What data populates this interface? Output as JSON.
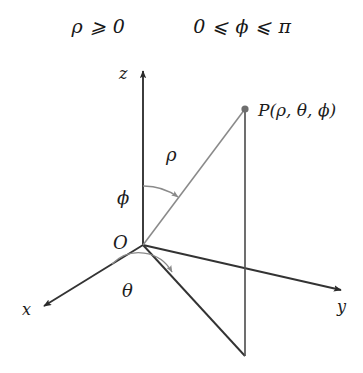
{
  "figure": {
    "title_conditions": [
      {
        "id": "rho-condition",
        "text": "ρ ⩾ 0"
      },
      {
        "id": "phi-condition",
        "text": "0 ⩽ ϕ ⩽ π"
      }
    ],
    "axes": [
      {
        "name": "z",
        "label": "z"
      },
      {
        "name": "x",
        "label": "x"
      },
      {
        "name": "y",
        "label": "y"
      }
    ],
    "origin": {
      "label": "O"
    },
    "point": {
      "label": "P(ρ, θ, ϕ)"
    },
    "segments": [
      {
        "name": "rho",
        "label": "ρ"
      }
    ],
    "angles": [
      {
        "name": "phi",
        "label": "ϕ"
      },
      {
        "name": "theta",
        "label": "θ"
      }
    ],
    "colors": {
      "axis": "#333333",
      "ray": "#8a8a8a",
      "arc": "#8a8a8a",
      "projection": "#333333",
      "point_dot": "#6e6e6e",
      "background": "#ffffff",
      "text": "#1c1c1c"
    }
  }
}
